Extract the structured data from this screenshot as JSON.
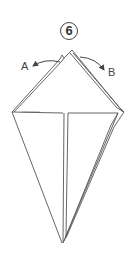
{
  "diagram": {
    "type": "origami-fold-step",
    "step_number": "6",
    "arrows": [
      {
        "label": "A",
        "direction": "left"
      },
      {
        "label": "B",
        "direction": "right"
      }
    ],
    "colors": {
      "line": "#555555",
      "accent_crease": "#7a3a8a",
      "background": "#ffffff"
    }
  }
}
